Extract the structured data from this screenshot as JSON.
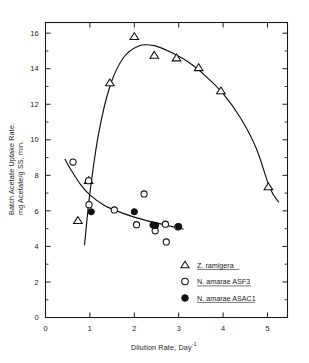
{
  "chart_data": {
    "type": "scatter",
    "title": "",
    "subtitle": "",
    "xlabel": "Dilution Rate, Day",
    "xlabel_superscript": "-1",
    "ylabel_line1": "Batch Acetate Uptake Rate,",
    "ylabel_line2": "mg Acetate/g SS, min.",
    "xlim": [
      0,
      5.45
    ],
    "ylim": [
      0,
      16.6
    ],
    "xticks": [
      0,
      1,
      2,
      3,
      4,
      5
    ],
    "xtick_labels": [
      "0",
      "1",
      "2",
      "3",
      "4",
      "5"
    ],
    "yticks": [
      0,
      2,
      4,
      6,
      8,
      10,
      12,
      14,
      16
    ],
    "ytick_labels": [
      "0",
      "2",
      "4",
      "6",
      "8",
      "10",
      "12",
      "14",
      "16"
    ],
    "yticks_minor": [
      1,
      3,
      5,
      7,
      9,
      11,
      13,
      15
    ],
    "grid": false,
    "frame": "box",
    "legend_position": "lower-right",
    "series": [
      {
        "name": "Z. ramigera",
        "marker": "open-triangle",
        "color": "#101010",
        "points": [
          {
            "x": 0.73,
            "y": 5.45
          },
          {
            "x": 0.97,
            "y": 7.7
          },
          {
            "x": 1.45,
            "y": 13.2
          },
          {
            "x": 2.0,
            "y": 15.8
          },
          {
            "x": 2.45,
            "y": 14.75
          },
          {
            "x": 2.95,
            "y": 14.6
          },
          {
            "x": 3.45,
            "y": 14.05
          },
          {
            "x": 3.95,
            "y": 12.75
          },
          {
            "x": 5.02,
            "y": 7.35
          }
        ]
      },
      {
        "name": "N. amarae ASF3",
        "marker": "open-circle",
        "color": "#101010",
        "points": [
          {
            "x": 0.62,
            "y": 8.75
          },
          {
            "x": 0.97,
            "y": 7.7
          },
          {
            "x": 0.98,
            "y": 6.35
          },
          {
            "x": 1.55,
            "y": 6.05
          },
          {
            "x": 2.05,
            "y": 5.22
          },
          {
            "x": 2.22,
            "y": 6.95
          },
          {
            "x": 2.47,
            "y": 4.88
          },
          {
            "x": 2.7,
            "y": 5.25
          },
          {
            "x": 2.72,
            "y": 4.25
          },
          {
            "x": 2.98,
            "y": 5.1
          }
        ]
      },
      {
        "name": "N. amarae ASAC1",
        "marker": "filled-circle",
        "color": "#101010",
        "points": [
          {
            "x": 1.03,
            "y": 5.95
          },
          {
            "x": 2.0,
            "y": 5.95
          },
          {
            "x": 2.42,
            "y": 5.2
          },
          {
            "x": 2.48,
            "y": 5.18
          },
          {
            "x": 3.0,
            "y": 5.12
          }
        ]
      }
    ],
    "curves": [
      {
        "name": "z-ramigera-fit",
        "description": "rising then falling fitted curve through Z. ramigera points",
        "points": [
          {
            "x": 0.88,
            "y": 4.1
          },
          {
            "x": 1.0,
            "y": 7.0
          },
          {
            "x": 1.2,
            "y": 10.4
          },
          {
            "x": 1.45,
            "y": 13.0
          },
          {
            "x": 1.75,
            "y": 14.6
          },
          {
            "x": 2.1,
            "y": 15.28
          },
          {
            "x": 2.45,
            "y": 15.3
          },
          {
            "x": 2.8,
            "y": 14.95
          },
          {
            "x": 3.2,
            "y": 14.4
          },
          {
            "x": 3.6,
            "y": 13.6
          },
          {
            "x": 4.0,
            "y": 12.6
          },
          {
            "x": 4.4,
            "y": 11.2
          },
          {
            "x": 4.75,
            "y": 9.5
          },
          {
            "x": 5.05,
            "y": 7.3
          },
          {
            "x": 5.25,
            "y": 6.5
          }
        ]
      },
      {
        "name": "n-amarae-fit",
        "description": "monotonically decaying fitted curve through N. amarae points",
        "points": [
          {
            "x": 0.44,
            "y": 8.9
          },
          {
            "x": 0.6,
            "y": 8.2
          },
          {
            "x": 0.8,
            "y": 7.45
          },
          {
            "x": 1.0,
            "y": 6.9
          },
          {
            "x": 1.3,
            "y": 6.35
          },
          {
            "x": 1.6,
            "y": 6.0
          },
          {
            "x": 2.0,
            "y": 5.65
          },
          {
            "x": 2.4,
            "y": 5.38
          },
          {
            "x": 2.8,
            "y": 5.15
          },
          {
            "x": 3.1,
            "y": 4.98
          }
        ]
      }
    ]
  },
  "legend": {
    "entries": [
      {
        "marker": "open-triangle",
        "label": "Z. ramigera"
      },
      {
        "marker": "open-circle",
        "label": "N. amarae ASF3"
      },
      {
        "marker": "filled-circle",
        "label": "N. amarae ASAC1"
      }
    ]
  }
}
